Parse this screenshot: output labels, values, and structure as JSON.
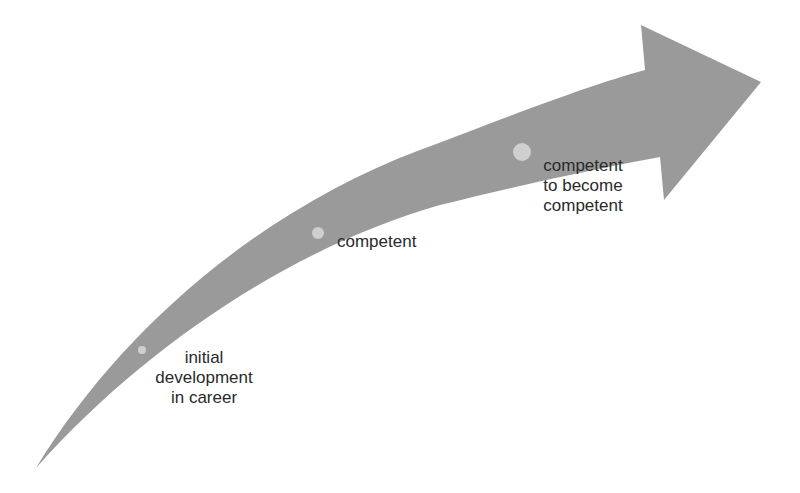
{
  "diagram": {
    "type": "curved-growth-arrow",
    "colors": {
      "arrow": "#9a9a9a",
      "dot": "#cfcfcf",
      "text": "#2a2a2a",
      "background": "#ffffff"
    },
    "stages": [
      {
        "label_lines": [
          "initial",
          "development",
          "in career"
        ]
      },
      {
        "label_lines": [
          "competent"
        ]
      },
      {
        "label_lines": [
          "competent",
          "to become",
          "competent"
        ]
      }
    ]
  }
}
